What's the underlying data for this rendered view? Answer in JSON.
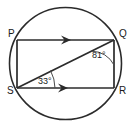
{
  "figure": {
    "type": "circle-geometry-diagram",
    "colors": {
      "stroke": "#2b2b2b",
      "arc": "#4a4a4a",
      "text": "#1a1a1a",
      "background": "#ffffff"
    },
    "circle": {
      "center_x": 65.5,
      "center_y": 63.5,
      "radius": 56
    },
    "vertices": [
      {
        "name": "P",
        "label": "P",
        "x": 17,
        "y": 40,
        "label_x": 8,
        "label_y": 37
      },
      {
        "name": "Q",
        "label": "Q",
        "x": 114,
        "y": 40,
        "label_x": 119,
        "label_y": 37
      },
      {
        "name": "R",
        "label": "R",
        "x": 114,
        "y": 88,
        "label_x": 119,
        "label_y": 94
      },
      {
        "name": "S",
        "label": "S",
        "x": 17,
        "y": 88,
        "label_x": 7,
        "label_y": 94
      }
    ],
    "segments": [
      {
        "name": "PQ",
        "from": "P",
        "to": "Q",
        "parallel_mark": "single-arrow"
      },
      {
        "name": "SR",
        "from": "S",
        "to": "R",
        "parallel_mark": "single-arrow"
      },
      {
        "name": "PS",
        "from": "P",
        "to": "S",
        "parallel_mark": "none"
      },
      {
        "name": "QR",
        "from": "Q",
        "to": "R",
        "parallel_mark": "none"
      },
      {
        "name": "SQ",
        "from": "S",
        "to": "Q",
        "parallel_mark": "none"
      }
    ],
    "angles": [
      {
        "name": "angle-SQR",
        "vertex": "Q",
        "value": "81°",
        "degrees": 81,
        "label_x": 92,
        "label_y": 58
      },
      {
        "name": "angle-QSR",
        "vertex": "S",
        "value": "33°",
        "degrees": 33,
        "label_x": 38,
        "label_y": 84
      }
    ]
  }
}
